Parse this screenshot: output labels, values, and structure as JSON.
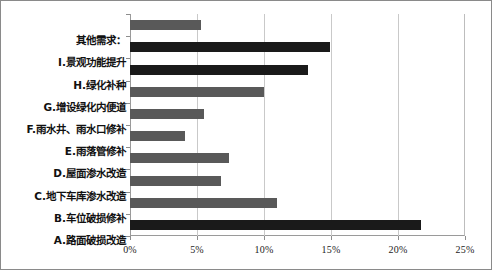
{
  "chart_data": {
    "type": "bar",
    "orientation": "horizontal",
    "title": "",
    "xlabel": "",
    "ylabel": "",
    "xlim": [
      0,
      25
    ],
    "xticks": [
      0,
      5,
      10,
      15,
      20,
      25
    ],
    "xtick_labels": [
      "0%",
      "5%",
      "10%",
      "15%",
      "20%",
      "25%"
    ],
    "grid": true,
    "legend": "none",
    "categories": [
      "其他需求：",
      "I.景观功能提升",
      "H.绿化补种",
      "G.增设绿化内便道",
      "F.雨水井、雨水口修补",
      "E.雨落管修补",
      "D.屋面渗水改造",
      "C.地下车库渗水改造",
      "B.车位破损修补",
      "A.路面破损改造"
    ],
    "values": [
      5.3,
      14.9,
      13.3,
      10.0,
      5.5,
      4.1,
      7.4,
      6.8,
      11.0,
      21.7
    ],
    "bar_colors": [
      "#595959",
      "#1a1a1a",
      "#1a1a1a",
      "#595959",
      "#595959",
      "#595959",
      "#595959",
      "#595959",
      "#595959",
      "#1a1a1a"
    ],
    "colors": {
      "gray_bar": "#595959",
      "dark_bar": "#1a1a1a",
      "gridline": "#c9c9c9",
      "axis": "#9a9a9a",
      "text": "#111111",
      "background": "#ffffff"
    }
  }
}
